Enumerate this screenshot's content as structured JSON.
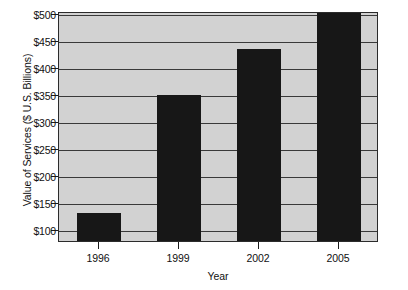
{
  "chart_data": {
    "type": "bar",
    "title": "",
    "subtitle": "",
    "xlabel": "Year",
    "ylabel": "Value of Services ($ U.S. Billions)",
    "categories": [
      "1996",
      "1999",
      "2002",
      "2005"
    ],
    "values": [
      132,
      350,
      435,
      505
    ],
    "series": [
      {
        "name": "Value of Services",
        "values": [
          132,
          350,
          435,
          505
        ]
      }
    ],
    "ytick_labels": [
      "$500",
      "$450",
      "$400",
      "$350",
      "$300",
      "$250",
      "$200",
      "$150",
      "$100"
    ],
    "ytick_values": [
      500,
      450,
      400,
      350,
      300,
      250,
      200,
      150,
      100
    ],
    "ylim": [
      80,
      505
    ],
    "xlim_note": "categorical axis with 4 evenly spaced year categories",
    "grid": "horizontal gridlines only",
    "legend": "none",
    "annotations": [
      "2005 bar is clipped at the top of the plot area, exceeding the $500 gridline"
    ],
    "colors": {
      "bar": "#171717",
      "plot_background": "#d2d2d2",
      "gridline": "#3a3a3a",
      "axis": "#2b2b2b",
      "figure_background": "#ffffff",
      "text": "#111111"
    }
  },
  "axes": {
    "y_title": "Value of Services ($ U.S. Billions)",
    "x_title": "Year"
  }
}
